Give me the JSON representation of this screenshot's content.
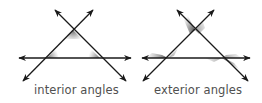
{
  "diagrams": [
    {
      "id": "interior",
      "label": "interior angles",
      "shading": "interior",
      "horizontal_line": {
        "x1": 19,
        "x2": 131,
        "y": 58
      },
      "line_a": {
        "x1": 23,
        "y1": 81,
        "x2": 93,
        "y2": 10
      },
      "line_b": {
        "x1": 55,
        "y1": 10,
        "x2": 126,
        "y2": 81
      },
      "vertices": {
        "apex": [
          73,
          30
        ],
        "left": [
          47,
          58
        ],
        "right": [
          100,
          58
        ]
      }
    },
    {
      "id": "exterior",
      "label": "exterior angles",
      "shading": "exterior",
      "horizontal_line": {
        "x1": 142,
        "x2": 250,
        "y": 58
      },
      "line_a": {
        "x1": 143,
        "y1": 81,
        "x2": 214,
        "y2": 10
      },
      "line_b": {
        "x1": 177,
        "y1": 10,
        "x2": 248,
        "y2": 81
      },
      "vertices": {
        "apex": [
          195,
          30
        ],
        "left": [
          168,
          58
        ],
        "right": [
          222,
          58
        ]
      }
    }
  ],
  "colors": {
    "line": "#1a1a1a",
    "shade": "#6a6a6a",
    "label": "#505050"
  }
}
